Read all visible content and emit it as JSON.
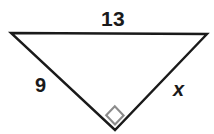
{
  "figure": {
    "background_color": "#ffffff",
    "stroke_color": "#1a1a1a",
    "right_angle_color": "#8c8c8c",
    "vertices": {
      "top_left": {
        "x": 11,
        "y": 33
      },
      "top_right": {
        "x": 207,
        "y": 34
      },
      "bottom": {
        "x": 115,
        "y": 130
      }
    },
    "sides": [
      {
        "name": "hypotenuse",
        "label": "13",
        "from": "top_left",
        "to": "top_right"
      },
      {
        "name": "leg-left",
        "label": "9",
        "from": "top_left",
        "to": "bottom"
      },
      {
        "name": "leg-right",
        "label": "x",
        "from": "top_right",
        "to": "bottom"
      }
    ],
    "right_angle": {
      "at_vertex": "bottom",
      "marker": "square",
      "size": 16
    }
  },
  "labels": {
    "hypotenuse": "13",
    "leg_a": "9",
    "leg_b": "x"
  }
}
